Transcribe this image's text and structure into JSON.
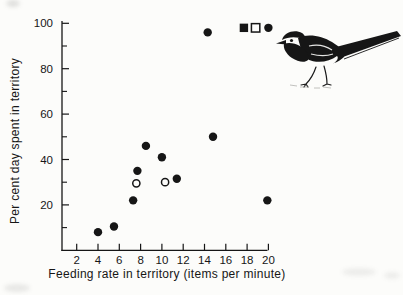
{
  "figure": {
    "background": "#fcfcfa",
    "ink": "#161616",
    "bird_illustration": "pied-wagtail"
  },
  "chart_data": {
    "type": "scatter",
    "title": "",
    "xlabel": "Feeding rate in territory (items per minute)",
    "ylabel": "Per cent day spent in territory",
    "xlim": [
      0,
      20.6
    ],
    "ylim": [
      0,
      100
    ],
    "x_ticks": [
      2,
      4,
      6,
      8,
      10,
      12,
      14,
      16,
      18,
      20
    ],
    "y_ticks_major": [
      20,
      40,
      60,
      80,
      100
    ],
    "y_ticks_minor": [
      10,
      30,
      50,
      70,
      90
    ],
    "grid": false,
    "legend_position": "none",
    "series": [
      {
        "name": "filled-circle",
        "marker": "circle",
        "fill": "black",
        "points": [
          [
            4.0,
            8
          ],
          [
            5.5,
            10.5
          ],
          [
            7.3,
            22
          ],
          [
            7.7,
            35
          ],
          [
            8.5,
            46
          ],
          [
            10.0,
            41
          ],
          [
            11.4,
            31.5
          ],
          [
            14.3,
            96
          ],
          [
            14.8,
            50
          ],
          [
            19.9,
            22
          ],
          [
            20.0,
            98
          ]
        ]
      },
      {
        "name": "open-circle",
        "marker": "circle",
        "fill": "white",
        "points": [
          [
            7.6,
            29.5
          ],
          [
            10.3,
            30
          ]
        ]
      },
      {
        "name": "filled-square",
        "marker": "square",
        "fill": "black",
        "points": [
          [
            17.7,
            98
          ]
        ]
      },
      {
        "name": "open-square",
        "marker": "square",
        "fill": "white",
        "points": [
          [
            18.8,
            98
          ]
        ]
      }
    ]
  }
}
